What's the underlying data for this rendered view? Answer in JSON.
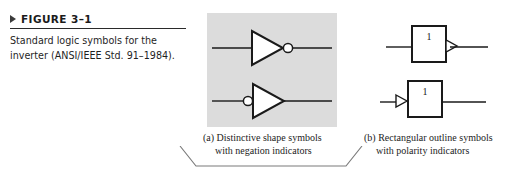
{
  "figure": {
    "marker_icon": "right-triangle-marker-icon",
    "label": "FIGURE 3–1",
    "caption_line1": "Standard logic symbols for the",
    "caption_line2": "inverter (ANSI/IEEE Std. 91–1984).",
    "caption_full": "Standard logic symbols for the inverter (ANSI/IEEE Std. 91–1984)."
  },
  "panel_a": {
    "background_color": "#dcdcdc",
    "subcaption_line1": "(a) Distinctive shape symbols",
    "subcaption_line2": "with negation indicators",
    "symbols": [
      {
        "name": "inverter-output-bubble",
        "shape": "triangle",
        "negation_indicator": "output",
        "icon": "inverter-triangle-icon"
      },
      {
        "name": "inverter-input-bubble",
        "shape": "triangle",
        "negation_indicator": "input",
        "icon": "inverter-triangle-icon"
      }
    ]
  },
  "panel_b": {
    "subcaption_line1": "(b) Rectangular outline symbols",
    "subcaption_line2": "with polarity indicators",
    "symbols": [
      {
        "name": "rect-output-polarity",
        "shape": "rectangle",
        "qualifier_label": "1",
        "polarity_indicator": "output",
        "icon": "rectangular-outline-icon"
      },
      {
        "name": "rect-input-polarity",
        "shape": "rectangle",
        "qualifier_label": "1",
        "polarity_indicator": "input",
        "icon": "rectangular-outline-icon"
      }
    ]
  },
  "colors": {
    "panel_fill": "#dcdcdc",
    "line": "#1a1a1a",
    "rule": "#2a2a2a",
    "text": "#1c1c1c",
    "bracket": "#7a7a7a"
  }
}
